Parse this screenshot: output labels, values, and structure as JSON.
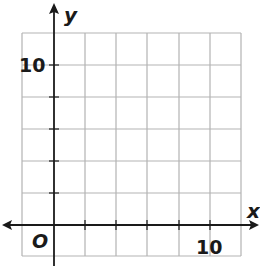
{
  "graph": {
    "x_axis_label": "x",
    "y_axis_label": "y",
    "origin_label": "O",
    "x_tick_label": "10",
    "y_tick_label": "10",
    "grid": {
      "columns": 7,
      "rows": 7,
      "units_per_square": 2,
      "x_range": [
        -2,
        12
      ],
      "y_range": [
        -2,
        12
      ]
    },
    "colors": {
      "grid": "#b3b3b3",
      "axis": "#1a1a1a",
      "background": "#ffffff"
    }
  }
}
